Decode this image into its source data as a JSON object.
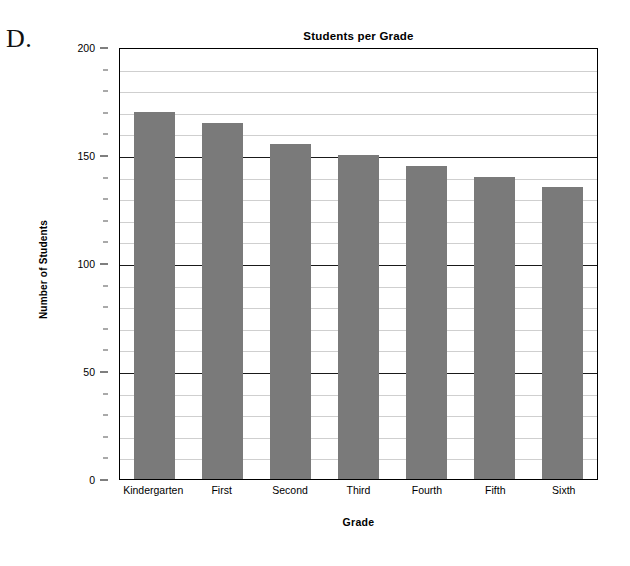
{
  "panel": {
    "letter": "D."
  },
  "chart_data": {
    "type": "bar",
    "title": "Students per Grade",
    "xlabel": "Grade",
    "ylabel": "Number of Students",
    "categories": [
      "Kindergarten",
      "First",
      "Second",
      "Third",
      "Fourth",
      "Fifth",
      "Sixth"
    ],
    "values": [
      170,
      165,
      155,
      150,
      145,
      140,
      135
    ],
    "ylim": [
      0,
      200
    ],
    "major_ticks": [
      0,
      50,
      100,
      150,
      200
    ],
    "major_tick_labels": [
      "0",
      "50",
      "100",
      "150",
      "200"
    ],
    "minor_tick_step": 10,
    "grid": true,
    "grid_axis": "y",
    "legend": false,
    "bar_color": "#7a7a7a",
    "axis_color": "#000000",
    "major_grid_color": "#1a1a1a",
    "minor_grid_color": "#cfcfcf",
    "background_color": "#ffffff"
  }
}
